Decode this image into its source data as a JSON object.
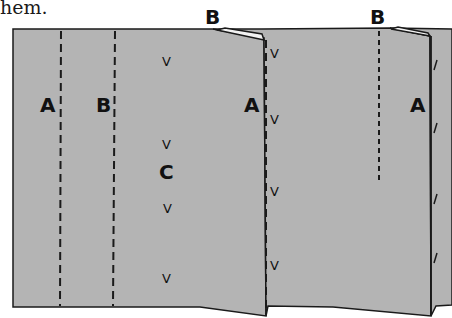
{
  "caption": "hem.",
  "colors": {
    "fabric": "#b4b4b4",
    "outline": "#1a1a1a",
    "background": "#ffffff"
  },
  "labels": {
    "top_b_left": "B",
    "top_b_right": "B",
    "a_left": "A",
    "b_left": "B",
    "c_center": "C",
    "a_middle": "A",
    "a_right": "A"
  },
  "marks": {
    "notch": "V",
    "slash": "/"
  },
  "diagram": {
    "lines": [
      {
        "id": "A-left",
        "style": "dashed",
        "x": 61
      },
      {
        "id": "B-left",
        "style": "dashed",
        "x": 114
      },
      {
        "id": "A-middle",
        "style": "dashed",
        "x": 266
      },
      {
        "id": "B-right",
        "style": "dashed-short",
        "x": 379
      },
      {
        "id": "A-right",
        "style": "solid",
        "x": 431
      }
    ]
  }
}
